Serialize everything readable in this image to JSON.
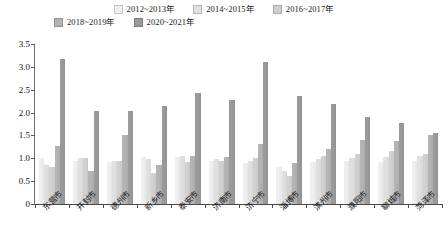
{
  "chart_data": {
    "type": "bar",
    "title": "",
    "subtitle": "",
    "xlabel": "",
    "ylabel": "",
    "ylim": [
      0,
      3.5
    ],
    "ytick_labels": [
      "0",
      "0.5",
      "1.0",
      "1.5",
      "2.0",
      "2.5",
      "3.0",
      "3.5"
    ],
    "ytick_values": [
      0,
      0.5,
      1.0,
      1.5,
      2.0,
      2.5,
      3.0,
      3.5
    ],
    "grid": false,
    "legend_position": "top-center",
    "categories": [
      "东营市",
      "开封市",
      "德州市",
      "新乡市",
      "泰安市",
      "济南市",
      "济宁市",
      "淄博市",
      "滨州市",
      "濮阳市",
      "聊城市",
      "菏泽市"
    ],
    "series": [
      {
        "name": "2012~2013年",
        "color": "#efefef",
        "values": [
          1.0,
          0.95,
          0.93,
          1.03,
          1.02,
          0.95,
          0.9,
          0.8,
          0.92,
          0.95,
          0.93,
          0.95
        ]
      },
      {
        "name": "2014~2015年",
        "color": "#e0e0e0",
        "values": [
          0.85,
          1.0,
          0.95,
          0.98,
          1.05,
          0.98,
          0.95,
          0.72,
          0.98,
          1.0,
          1.02,
          1.05
        ]
      },
      {
        "name": "2016~2017年",
        "color": "#d0d0d0",
        "values": [
          0.82,
          1.0,
          0.95,
          0.68,
          0.92,
          0.95,
          1.0,
          0.62,
          1.05,
          1.1,
          1.15,
          1.1
        ]
      },
      {
        "name": "2018~2019年",
        "color": "#b4b4b4",
        "values": [
          1.28,
          0.73,
          1.5,
          0.85,
          1.05,
          1.02,
          1.32,
          0.9,
          1.2,
          1.4,
          1.38,
          1.5
        ]
      },
      {
        "name": "2020~2021年",
        "color": "#9a9a9a",
        "values": [
          3.18,
          2.03,
          2.03,
          2.15,
          2.43,
          2.28,
          3.1,
          2.37,
          2.18,
          1.9,
          1.78,
          1.55
        ]
      }
    ]
  }
}
